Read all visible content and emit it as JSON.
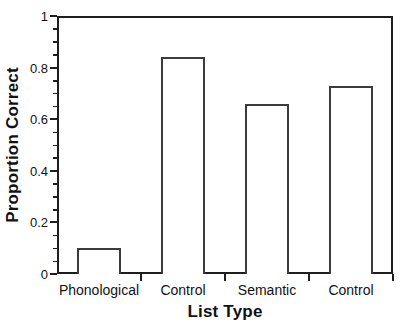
{
  "figure": {
    "background": "#ffffff",
    "axis_color": "#1e1e1e",
    "bar_fill": "#ffffff",
    "bar_border": "#3c3c3c",
    "text_color": "#121212"
  },
  "chart_data": {
    "type": "bar",
    "title": "",
    "xlabel": "List Type",
    "ylabel": "Proportion Correct",
    "categories": [
      "Phonological",
      "Control",
      "Semantic",
      "Control"
    ],
    "values": [
      0.1,
      0.84,
      0.66,
      0.73
    ],
    "ylim": [
      0,
      1
    ],
    "y_major_ticks": [
      0,
      0.2,
      0.4,
      0.6,
      0.8,
      1
    ],
    "y_tick_labels": [
      "0",
      "0.2",
      "0.4",
      "0.6",
      "0.8",
      "1"
    ],
    "y_minor_tick_step": 0.05,
    "bar_width_fraction": 0.52,
    "grid": false,
    "frame": "box",
    "legend": null
  }
}
